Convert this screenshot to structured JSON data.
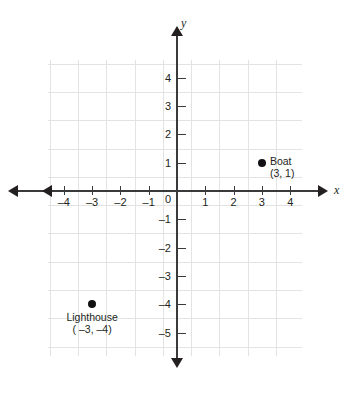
{
  "chart_data": {
    "type": "scatter",
    "title": "",
    "xlabel": "x",
    "ylabel": "y",
    "xlim": [
      -4.5,
      4.5
    ],
    "ylim": [
      -5.5,
      5.5
    ],
    "grid": true,
    "legend": "none",
    "xticks": [
      "-4",
      "-3",
      "-2",
      "-1",
      "0",
      "1",
      "2",
      "3",
      "4"
    ],
    "xtick_values": [
      -4,
      -3,
      -2,
      -1,
      0,
      1,
      2,
      3,
      4
    ],
    "yticks": [
      "4",
      "3",
      "2",
      "1",
      "-1",
      "-2",
      "-3",
      "-4",
      "-5"
    ],
    "ytick_values": [
      4,
      3,
      2,
      1,
      -1,
      -2,
      -3,
      -4,
      -5
    ],
    "origin_label": "0",
    "points": [
      {
        "name": "Boat",
        "label_line1": "Boat",
        "label_line2": "(3, 1)",
        "x": 3,
        "y": 1,
        "color": "#111113"
      },
      {
        "name": "Lighthouse",
        "label_line1": "Lighthouse",
        "label_line2": "( –3, –4)",
        "x": -3,
        "y": -4,
        "color": "#111113"
      }
    ],
    "colors": {
      "grid": "#e3e3e4",
      "axis": "#3a3a3c",
      "text": "#231f20",
      "point": "#111113",
      "background": "#ffffff"
    }
  },
  "axes": {
    "x_name": "x",
    "y_name": "y"
  },
  "ticks": {
    "x": [
      {
        "label": "-4",
        "display": "–4"
      },
      {
        "label": "-3",
        "display": "–3"
      },
      {
        "label": "-2",
        "display": "–2"
      },
      {
        "label": "-1",
        "display": "–1"
      },
      {
        "label": "0",
        "display": "0"
      },
      {
        "label": "1",
        "display": "1"
      },
      {
        "label": "2",
        "display": "2"
      },
      {
        "label": "3",
        "display": "3"
      },
      {
        "label": "4",
        "display": "4"
      }
    ],
    "y": [
      {
        "label": "4",
        "display": "4"
      },
      {
        "label": "3",
        "display": "3"
      },
      {
        "label": "2",
        "display": "2"
      },
      {
        "label": "1",
        "display": "1"
      },
      {
        "label": "-1",
        "display": "–1"
      },
      {
        "label": "-2",
        "display": "–2"
      },
      {
        "label": "-3",
        "display": "–3"
      },
      {
        "label": "-4",
        "display": "–4"
      },
      {
        "label": "-5",
        "display": "–5"
      }
    ]
  },
  "annotations": {
    "boat": {
      "title": "Boat",
      "coords": "(3, 1)"
    },
    "lighthouse": {
      "title": "Lighthouse",
      "coords": "( –3, –4)"
    }
  }
}
